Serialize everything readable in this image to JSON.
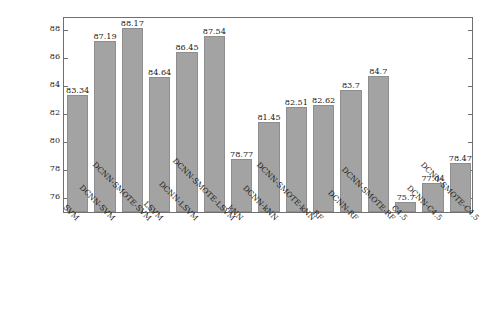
{
  "chart_data": {
    "type": "bar",
    "title": "",
    "subtitle": "",
    "xlabel": "",
    "ylabel": "Accuracy mean(%)",
    "ylim": [
      75,
      89
    ],
    "yticks": [
      76,
      78,
      80,
      82,
      84,
      86,
      88
    ],
    "ytick_labels": [
      "76",
      "78",
      "80",
      "82",
      "84",
      "86",
      "88"
    ],
    "grid": false,
    "legend": null,
    "bar_color": "#a3a3a3",
    "bar_edge_color": "#8e8e8e",
    "axis_color": "#6f6f6f",
    "categories": [
      "SVM",
      "DCNN-SVM",
      "DCNN-SMOTE-SVM",
      "LSVM",
      "DCNN-LSVM",
      "DCNN-SMOTE-LSVM",
      "kNN",
      "DCNN-kNN",
      "DCNN-SMOTE-kNN",
      "RF",
      "DCNN-RF",
      "DCNN-SMOTE-RF",
      "C4.5",
      "DCNN-C4.5",
      "DCNN-SMOTE-C4.5"
    ],
    "values": [
      83.34,
      87.19,
      88.17,
      84.64,
      86.45,
      87.54,
      78.77,
      81.45,
      82.51,
      82.62,
      83.7,
      84.7,
      75.7,
      77.04,
      78.47
    ],
    "value_labels": [
      "83.34",
      "87.19",
      "88.17",
      "84.64",
      "86.45",
      "87.54",
      "78.77",
      "81.45",
      "82.51",
      "82.62",
      "83.7",
      "84.7",
      "75.7",
      "77.04",
      "78.47"
    ]
  }
}
